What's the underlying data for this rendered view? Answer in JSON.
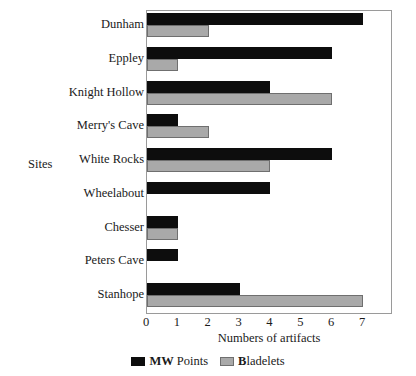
{
  "chart_data": {
    "type": "bar",
    "orientation": "horizontal",
    "title": "",
    "xlabel": "Numbers of artifacts",
    "ylabel": "Sites",
    "xlim": [
      0,
      7
    ],
    "xticks": [
      0,
      1,
      2,
      3,
      4,
      5,
      6,
      7
    ],
    "xtick_labels": [
      "0",
      "1",
      "2",
      "3",
      "4",
      "5",
      "6",
      "7"
    ],
    "grid": false,
    "legend_position": "bottom-center",
    "categories": [
      "Dunham",
      "Eppley",
      "Knight Hollow",
      "Merry's Cave",
      "White Rocks",
      "Wheelabout",
      "Chesser",
      "Peters Cave",
      "Stanhope"
    ],
    "series": [
      {
        "name": "MW Points",
        "color": "#0d0d0d",
        "values": [
          7,
          6,
          4,
          1,
          6,
          4,
          1,
          1,
          3
        ]
      },
      {
        "name": "Bladelets",
        "color": "#a9a9a9",
        "values": [
          2,
          1,
          6,
          2,
          4,
          0,
          1,
          0,
          7
        ]
      }
    ],
    "legend": [
      {
        "label": "MW Points",
        "lead": "MW",
        "rest": " Points",
        "color": "#0d0d0d"
      },
      {
        "label": "Bladelets",
        "lead": "B",
        "rest": "ladelets",
        "color": "#a9a9a9"
      }
    ]
  },
  "colors": {
    "series_0": "#0d0d0d",
    "series_1": "#a9a9a9",
    "series_1_border": "#6f6f6f",
    "axis": "#9a9a9a",
    "text": "#1a1a1a",
    "background": "#ffffff"
  }
}
